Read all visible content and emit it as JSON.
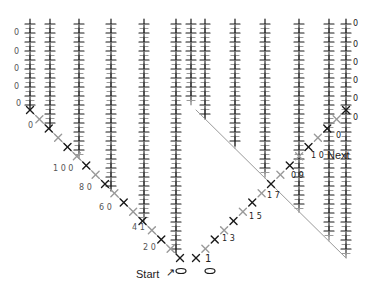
{
  "diagram": {
    "type": "crochet-chart",
    "colors": {
      "dark": "#1a1a1a",
      "light": "#9a9a9a",
      "background": "#ffffff"
    },
    "columns_x": [
      30,
      50,
      79,
      111,
      144,
      176,
      191,
      205,
      235,
      265,
      299,
      329,
      346
    ],
    "top_y": 24,
    "row_step": 9,
    "diagonal_left": {
      "x1": 30,
      "y1": 110,
      "x2": 180,
      "y2": 258
    },
    "diagonal_right": {
      "x1": 196,
      "y1": 258,
      "x2": 346,
      "y2": 110
    },
    "labels": {
      "start": "Start",
      "start_arrow": "↗",
      "next": "Next",
      "right_counts": [
        "1",
        "1 3",
        "1 5",
        "1 7",
        "0 9",
        "1 0"
      ],
      "left_counts": [
        "2 0",
        "4 1",
        "6 0",
        "8 0",
        "1 0 0",
        "0"
      ],
      "edge_zeros_left": [
        "0",
        "0",
        "0",
        "0",
        "0"
      ],
      "edge_zeros_right": [
        "0",
        "0",
        "0",
        "0",
        "0",
        "0",
        "0"
      ]
    }
  }
}
